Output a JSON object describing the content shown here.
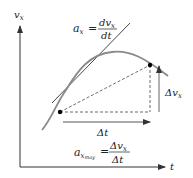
{
  "axes": {
    "y_label": "v",
    "y_label_sub": "x",
    "x_label": "t"
  },
  "instantaneous": {
    "lhs": "a",
    "lhs_sub": "x",
    "equals": "=",
    "num": "dv",
    "num_sub": "x",
    "den": "dt"
  },
  "average": {
    "lhs": "a",
    "lhs_sub": "x",
    "lhs_subsub": "moy",
    "equals": "=",
    "num": "Δv",
    "num_sub": "x",
    "den": "Δt"
  },
  "delta_t_label": "Δt",
  "delta_v_label": "Δv",
  "delta_v_sub": "x",
  "colors": {
    "curve": "#8a8a8a",
    "line": "#333333",
    "dashed": "#444444",
    "point": "#000000"
  }
}
